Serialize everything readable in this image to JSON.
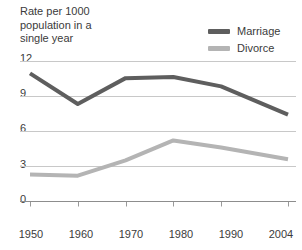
{
  "chart_data": {
    "type": "line",
    "title": "Rate per 1000\npopulation in a\nsingle year",
    "xlabel": "",
    "ylabel": "",
    "x": [
      1950,
      1960,
      1970,
      1980,
      1990,
      2004
    ],
    "categories": [
      "1950",
      "1960",
      "1970",
      "1980",
      "1990",
      "2004"
    ],
    "series": [
      {
        "name": "Marriage",
        "color": "#5e5e5e",
        "values": [
          10.9,
          8.3,
          10.5,
          10.6,
          9.8,
          7.4
        ]
      },
      {
        "name": "Divorce",
        "color": "#b4b4b4",
        "values": [
          2.3,
          2.2,
          3.5,
          5.2,
          4.6,
          3.6
        ]
      }
    ],
    "ylim": [
      0,
      12
    ],
    "xlim": [
      1950,
      2004
    ],
    "yticks": [
      0,
      3,
      6,
      9,
      12
    ],
    "ytick_labels": [
      "0",
      "3",
      "6",
      "9",
      "12"
    ],
    "xtick_labels": [
      "1950",
      "1960",
      "1970",
      "1980",
      "1990",
      "2004"
    ],
    "grid": true,
    "grid_color": "#c8c8c8",
    "legend_position": "top-right",
    "background": "#ffffff"
  },
  "legend": {
    "items": [
      {
        "label": "Marriage"
      },
      {
        "label": "Divorce"
      }
    ]
  },
  "axes": {
    "y_labels": [
      "12",
      "9",
      "6",
      "3",
      "0"
    ],
    "x_labels": [
      "1950",
      "1960",
      "1970",
      "1980",
      "1990",
      "2004"
    ]
  }
}
